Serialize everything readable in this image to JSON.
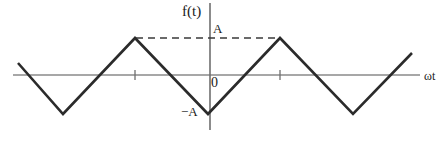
{
  "figure": {
    "title": "",
    "labels": {
      "y_axis": "f(t)",
      "x_axis": "ωt",
      "amplitude_positive": "A",
      "amplitude_negative": "−A",
      "origin": "0"
    },
    "colors": {
      "background": "#ffffff",
      "waveform": "#2b2b2b",
      "axis": "#8a8a8a",
      "dashed_guide": "#3a3a3a",
      "text": "#1a1a1a"
    }
  },
  "chart_data": {
    "type": "line",
    "title": "",
    "subtitle": "",
    "xlabel": "ωt",
    "ylabel": "f(t)",
    "grid": false,
    "legend": null,
    "xlim": [
      -2.25,
      2.25
    ],
    "ylim": [
      -1.35,
      1.35
    ],
    "yticks": [
      -1,
      0,
      1
    ],
    "ytick_labels": [
      "−A",
      "0",
      "A"
    ],
    "xticks": [
      -1,
      1
    ],
    "xtick_labels": [
      "",
      ""
    ],
    "period": 2,
    "amplitude": 1,
    "series": [
      {
        "name": "f(t)",
        "style": "solid",
        "color": "#2b2b2b",
        "x": [
          -2.18,
          -1.5,
          -0.5,
          0,
          1,
          1.5,
          2.0,
          2.85
        ],
        "y": [
          0.33,
          -1,
          1,
          -1,
          1,
          0,
          -1,
          0.63
        ],
        "vertices": [
          {
            "x": -2.18,
            "y": 0.33,
            "role": "start"
          },
          {
            "x": -1.5,
            "y": -1,
            "role": "minimum"
          },
          {
            "x": -0.5,
            "y": 1,
            "role": "maximum"
          },
          {
            "x": 0,
            "y": -1,
            "role": "minimum"
          },
          {
            "x": 1,
            "y": 1,
            "role": "maximum"
          },
          {
            "x": 2.0,
            "y": -1,
            "role": "minimum"
          },
          {
            "x": 2.85,
            "y": 0.63,
            "role": "end"
          }
        ]
      },
      {
        "name": "A level guide",
        "style": "dashed",
        "color": "#3a3a3a",
        "x": [
          -0.5,
          1
        ],
        "y": [
          1,
          1
        ]
      }
    ]
  },
  "geometry": {
    "x_axis": {
      "y": 75,
      "x_start": 13,
      "x_end": 420
    },
    "y_axis": {
      "x": 210,
      "y_start": 3,
      "y_end": 130
    },
    "peak_y": 38,
    "valley_y": 114,
    "waveform_points": "18,63 63,114 135,38 208,114 280,38 353,114 412,53",
    "dashed_line": {
      "y": 38,
      "x_start": 136,
      "x_end": 281
    },
    "x_ticks": [
      135,
      280
    ],
    "tick_half_height": 5
  }
}
